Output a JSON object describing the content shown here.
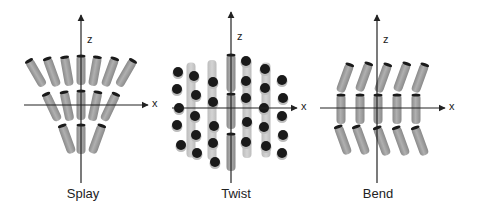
{
  "panels": [
    {
      "id": "splay",
      "caption": "Splay",
      "caption_x": 83,
      "axes": {
        "origin": [
          81,
          105
        ],
        "x_range": [
          24,
          148
        ],
        "z_range": [
          15,
          183
        ],
        "x_label": "x",
        "z_label": "z"
      },
      "rods": [
        {
          "cx": 36,
          "cy": 73,
          "angle": -30,
          "len": 30
        },
        {
          "cx": 52,
          "cy": 72,
          "angle": -20,
          "len": 30
        },
        {
          "cx": 67,
          "cy": 71,
          "angle": -10,
          "len": 30
        },
        {
          "cx": 81,
          "cy": 70,
          "angle": 0,
          "len": 30
        },
        {
          "cx": 95,
          "cy": 71,
          "angle": 10,
          "len": 30
        },
        {
          "cx": 110,
          "cy": 72,
          "angle": 20,
          "len": 30
        },
        {
          "cx": 126,
          "cy": 73,
          "angle": 30,
          "len": 30
        },
        {
          "cx": 52,
          "cy": 107,
          "angle": -25,
          "len": 30
        },
        {
          "cx": 67,
          "cy": 106,
          "angle": -12,
          "len": 30
        },
        {
          "cx": 81,
          "cy": 105,
          "angle": 0,
          "len": 30
        },
        {
          "cx": 95,
          "cy": 106,
          "angle": 12,
          "len": 30
        },
        {
          "cx": 110,
          "cy": 107,
          "angle": 25,
          "len": 30
        },
        {
          "cx": 67,
          "cy": 139,
          "angle": -20,
          "len": 30
        },
        {
          "cx": 81,
          "cy": 139,
          "angle": 0,
          "len": 30
        },
        {
          "cx": 97,
          "cy": 139,
          "angle": 20,
          "len": 30
        }
      ]
    },
    {
      "id": "twist",
      "caption": "Twist",
      "caption_x": 236,
      "axes": {
        "origin": [
          231,
          108
        ],
        "x_range": [
          172,
          297
        ],
        "z_range": [
          12,
          183
        ],
        "x_label": "x",
        "z_label": "z"
      },
      "rods": [
        {
          "cx": 191,
          "cy": 110,
          "angle": 0,
          "len": 95,
          "faded": true
        },
        {
          "cx": 212,
          "cy": 110,
          "angle": 0,
          "len": 100,
          "faded": true
        },
        {
          "cx": 231,
          "cy": 73,
          "angle": 0,
          "len": 38
        },
        {
          "cx": 231,
          "cy": 111,
          "angle": 0,
          "len": 36
        },
        {
          "cx": 231,
          "cy": 152,
          "angle": 0,
          "len": 38
        },
        {
          "cx": 247,
          "cy": 108,
          "angle": 0,
          "len": 100,
          "faded": true
        },
        {
          "cx": 266,
          "cy": 110,
          "angle": 0,
          "len": 95,
          "faded": true
        }
      ],
      "dots": [
        [
          178,
          72
        ],
        [
          177,
          89
        ],
        [
          179,
          108
        ],
        [
          177,
          125
        ],
        [
          181,
          145
        ],
        [
          194,
          76
        ],
        [
          196,
          95
        ],
        [
          195,
          116
        ],
        [
          196,
          135
        ],
        [
          197,
          153
        ],
        [
          213,
          82
        ],
        [
          213,
          102
        ],
        [
          214,
          126
        ],
        [
          213,
          143
        ],
        [
          215,
          162
        ],
        [
          246,
          61
        ],
        [
          246,
          81
        ],
        [
          246,
          98
        ],
        [
          247,
          122
        ],
        [
          246,
          142
        ],
        [
          265,
          69
        ],
        [
          265,
          88
        ],
        [
          264,
          108
        ],
        [
          264,
          127
        ],
        [
          266,
          146
        ],
        [
          282,
          80
        ],
        [
          283,
          98
        ],
        [
          282,
          116
        ],
        [
          283,
          135
        ],
        [
          282,
          153
        ]
      ]
    },
    {
      "id": "bend",
      "caption": "Bend",
      "caption_x": 378,
      "axes": {
        "origin": [
          377,
          108
        ],
        "x_range": [
          320,
          445
        ],
        "z_range": [
          15,
          183
        ],
        "x_label": "x",
        "z_label": "z"
      },
      "rods": [
        {
          "cx": 345,
          "cy": 78,
          "angle": 20,
          "len": 30
        },
        {
          "cx": 364,
          "cy": 77,
          "angle": 20,
          "len": 30
        },
        {
          "cx": 383,
          "cy": 78,
          "angle": 20,
          "len": 30
        },
        {
          "cx": 402,
          "cy": 77,
          "angle": 20,
          "len": 30
        },
        {
          "cx": 420,
          "cy": 78,
          "angle": 20,
          "len": 30
        },
        {
          "cx": 341,
          "cy": 109,
          "angle": 0,
          "len": 30
        },
        {
          "cx": 360,
          "cy": 109,
          "angle": 0,
          "len": 30
        },
        {
          "cx": 378,
          "cy": 109,
          "angle": 0,
          "len": 30
        },
        {
          "cx": 397,
          "cy": 109,
          "angle": 0,
          "len": 30
        },
        {
          "cx": 416,
          "cy": 109,
          "angle": 0,
          "len": 30
        },
        {
          "cx": 343,
          "cy": 140,
          "angle": -20,
          "len": 30
        },
        {
          "cx": 361,
          "cy": 140,
          "angle": -20,
          "len": 30
        },
        {
          "cx": 382,
          "cy": 141,
          "angle": -20,
          "len": 30
        },
        {
          "cx": 401,
          "cy": 141,
          "angle": -20,
          "len": 30
        },
        {
          "cx": 420,
          "cy": 141,
          "angle": -20,
          "len": 30
        }
      ]
    }
  ],
  "colors": {
    "rod": "#9a9a9a",
    "rod_edge": "#7a7a7a",
    "rod_faded": "#c4c4c4",
    "cap": "#1a1a1a",
    "axis": "#222222"
  }
}
